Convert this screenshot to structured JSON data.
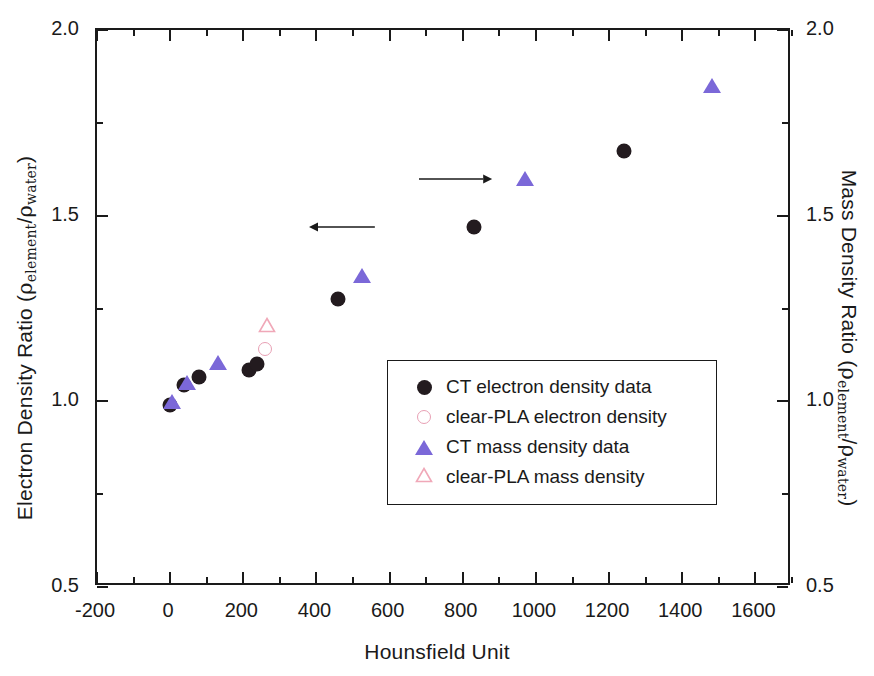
{
  "chart_data": {
    "type": "scatter",
    "title": "",
    "xlabel": "Hounsfield Unit",
    "ylabel_left": "Electron Density Ratio (ρelement/ρwater)",
    "ylabel_right": "Mass Density Ratio (ρelement/ρwater)",
    "xlim": [
      -200,
      1700
    ],
    "ylim": [
      0.5,
      2.0
    ],
    "ylim_right": [
      0.5,
      2.0
    ],
    "xticks": [
      -200,
      0,
      200,
      400,
      600,
      800,
      1000,
      1200,
      1400,
      1600
    ],
    "xtick_labels": [
      "-200",
      "0",
      "200",
      "400",
      "600",
      "800",
      "1000",
      "1200",
      "1400",
      "1600"
    ],
    "xtick_minor_step": 100,
    "yticks": [
      0.5,
      1.0,
      1.5,
      2.0
    ],
    "ytick_labels": [
      "0.5",
      "1.0",
      "1.5",
      "2.0"
    ],
    "ytick_minor_step": 0.25,
    "grid": false,
    "legend_position": "center-right",
    "series": [
      {
        "name": "CT electron density data",
        "marker": "filled-circle",
        "color": "#231b1f",
        "axis": "left",
        "points": [
          {
            "x": 0,
            "y": 0.99
          },
          {
            "x": 38,
            "y": 1.045
          },
          {
            "x": 80,
            "y": 1.065
          },
          {
            "x": 215,
            "y": 1.085
          },
          {
            "x": 238,
            "y": 1.1
          },
          {
            "x": 460,
            "y": 1.275
          },
          {
            "x": 830,
            "y": 1.47
          },
          {
            "x": 1240,
            "y": 1.675
          }
        ]
      },
      {
        "name": "clear-PLA electron density",
        "marker": "open-circle",
        "color": "#e8a0b4",
        "axis": "left",
        "points": [
          {
            "x": 258,
            "y": 1.14
          }
        ]
      },
      {
        "name": "CT mass density data",
        "marker": "filled-triangle",
        "color": "#7b68d8",
        "axis": "right",
        "points": [
          {
            "x": 5,
            "y": 1.0
          },
          {
            "x": 45,
            "y": 1.05
          },
          {
            "x": 130,
            "y": 1.105
          },
          {
            "x": 525,
            "y": 1.34
          },
          {
            "x": 970,
            "y": 1.6
          },
          {
            "x": 1480,
            "y": 1.85
          }
        ]
      },
      {
        "name": "clear-PLA mass density",
        "marker": "open-triangle",
        "color": "#f0a8b8",
        "axis": "right",
        "points": [
          {
            "x": 265,
            "y": 1.2
          }
        ]
      }
    ],
    "annotations": [
      {
        "type": "arrow",
        "direction": "left",
        "from_x": 560,
        "from_y": 1.47,
        "to_x": 380,
        "to_y": 1.47,
        "label": ""
      },
      {
        "type": "arrow",
        "direction": "right",
        "from_x": 680,
        "from_y": 1.6,
        "to_x": 880,
        "to_y": 1.6,
        "label": ""
      }
    ]
  },
  "legend": {
    "entries": [
      {
        "label": "CT electron density data",
        "marker": "filled-circle"
      },
      {
        "label": "clear-PLA electron density",
        "marker": "open-circle"
      },
      {
        "label": "CT mass density data",
        "marker": "filled-triangle"
      },
      {
        "label": "clear-PLA mass density",
        "marker": "open-triangle"
      }
    ]
  },
  "axes": {
    "x_title": "Hounsfield Unit",
    "y_left_prefix": "Electron Density Ratio (",
    "y_right_prefix": "Mass Density Ratio (",
    "rho": "ρ",
    "sub_element": "element",
    "slash": "/",
    "sub_water": "water",
    "paren_close": ")"
  }
}
